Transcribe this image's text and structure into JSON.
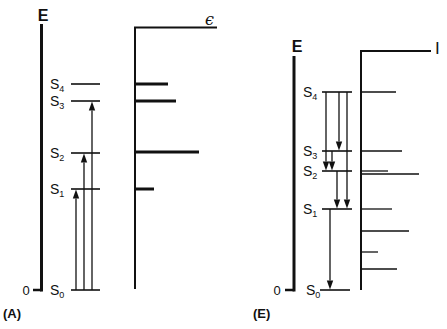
{
  "figure": {
    "description_visible": "Energy-level diagrams with absorption (A) and emission (E) transitions and corresponding line spectra",
    "ink_color": "#111111",
    "background_color": "#ffffff"
  },
  "panels": [
    {
      "id": "A",
      "label": "(A)",
      "label_pos": {
        "x": 3,
        "y": 318
      },
      "energy_axis_label": "E",
      "energy_axis_label_pos": {
        "x": 43,
        "y": 21
      },
      "zero_label": "0",
      "zero_label_pos": {
        "x": 26,
        "y": 295
      },
      "axis": {
        "x": 41.5,
        "top": 24,
        "bottom": 291.5,
        "tick_left": 33
      },
      "level_label_x": 50,
      "level_x1": 71,
      "level_x2": 100,
      "levels": [
        {
          "id": "S0",
          "name": "S",
          "sub": "0",
          "y": 290
        },
        {
          "id": "S1",
          "name": "S",
          "sub": "1",
          "y": 189
        },
        {
          "id": "S2",
          "name": "S",
          "sub": "2",
          "y": 153
        },
        {
          "id": "S3",
          "name": "S",
          "sub": "3",
          "y": 101
        },
        {
          "id": "S4",
          "name": "S",
          "sub": "4",
          "y": 84
        }
      ],
      "transitions": [
        {
          "from": "S0",
          "to": "S1",
          "x": 76
        },
        {
          "from": "S0",
          "to": "S2",
          "x": 84
        },
        {
          "from": "S0",
          "to": "S3",
          "x": 92
        }
      ],
      "spectrum": {
        "label": "ϵ",
        "label_style": "eps",
        "label_pos": {
          "x": 205,
          "y": 25
        },
        "axis_x": 135,
        "axis_top": 27.5,
        "axis_bottom": 289,
        "top_line_end": 217,
        "bar_width": 3,
        "lines": [
          {
            "level": "S1",
            "y": 189,
            "end_x": 154
          },
          {
            "level": "S2",
            "y": 152,
            "end_x": 199
          },
          {
            "level": "S3",
            "y": 101,
            "end_x": 176
          },
          {
            "level": "S4",
            "y": 84,
            "end_x": 168
          }
        ]
      }
    },
    {
      "id": "E",
      "label": "(E)",
      "label_pos": {
        "x": 253,
        "y": 318
      },
      "energy_axis_label": "E",
      "energy_axis_label_pos": {
        "x": 297,
        "y": 52
      },
      "zero_label": "0",
      "zero_label_pos": {
        "x": 277,
        "y": 295
      },
      "axis": {
        "x": 294,
        "top": 56,
        "bottom": 291.5,
        "tick_left": 285
      },
      "level_label_x": 303,
      "level_x1": 322,
      "level_x2": 352,
      "levels": [
        {
          "id": "S0",
          "name": "S",
          "sub": "0",
          "y": 290
        },
        {
          "id": "S1",
          "name": "S",
          "sub": "1",
          "y": 209
        },
        {
          "id": "S2",
          "name": "S",
          "sub": "2",
          "y": 171
        },
        {
          "id": "S3",
          "name": "S",
          "sub": "3",
          "y": 151
        },
        {
          "id": "S4",
          "name": "S",
          "sub": "4",
          "y": 92
        }
      ],
      "transitions": [
        {
          "from": "S4",
          "to": "S2",
          "x": 326
        },
        {
          "from": "S4",
          "to": "S3",
          "x": 339
        },
        {
          "from": "S4",
          "to": "S1",
          "x": 347
        },
        {
          "from": "S3",
          "to": "S2",
          "x": 332
        },
        {
          "from": "S2",
          "to": "S1",
          "x": 337
        },
        {
          "from": "S1",
          "to": "S0",
          "x": 330
        }
      ],
      "spectrum": {
        "label": "I",
        "label_style": "i",
        "label_pos": {
          "x": 435,
          "y": 54
        },
        "axis_x": 361,
        "axis_top": 51,
        "axis_bottom": 290,
        "top_line_end": 431,
        "bar_width": 1.3,
        "lines": [
          {
            "y": 92,
            "end_x": 396
          },
          {
            "y": 151,
            "end_x": 402
          },
          {
            "y": 171,
            "end_x": 388
          },
          {
            "y": 174,
            "end_x": 419
          },
          {
            "y": 209,
            "end_x": 392
          },
          {
            "y": 231,
            "end_x": 409
          },
          {
            "y": 252,
            "end_x": 378
          },
          {
            "y": 269,
            "end_x": 397
          }
        ]
      }
    }
  ]
}
